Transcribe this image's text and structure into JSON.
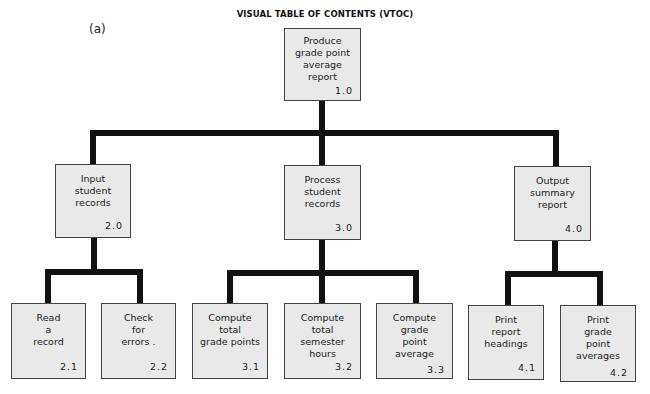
{
  "diagram": {
    "title": "VISUAL TABLE OF CONTENTS (VTOC)",
    "panel_label": "(a)",
    "line_color": "#111111",
    "box_fill": "#e9e9e9",
    "nodes": {
      "n1_0": {
        "text": "Produce\ngrade point\naverage\nreport",
        "number": "1.0"
      },
      "n2_0": {
        "text": "Input\nstudent\nrecords",
        "number": "2.0"
      },
      "n3_0": {
        "text": "Process\nstudent\nrecords",
        "number": "3.0"
      },
      "n4_0": {
        "text": "Output\nsummary\nreport",
        "number": "4.0"
      },
      "n2_1": {
        "text": "Read\na\nrecord",
        "number": "2.1"
      },
      "n2_2": {
        "text": "Check\nfor\nerrors .",
        "number": "2.2"
      },
      "n3_1": {
        "text": "Compute\ntotal\ngrade points",
        "number": "3.1"
      },
      "n3_2": {
        "text": "Compute\ntotal\nsemester\nhours",
        "number": "3.2"
      },
      "n3_3": {
        "text": "Compute\ngrade\npoint\naverage",
        "number": "3.3"
      },
      "n4_1": {
        "text": "Print\nreport\nheadings",
        "number": "4.1"
      },
      "n4_2": {
        "text": "Print\ngrade\npoint\naverages",
        "number": "4.2"
      }
    },
    "edges": [
      [
        "1.0",
        "2.0"
      ],
      [
        "1.0",
        "3.0"
      ],
      [
        "1.0",
        "4.0"
      ],
      [
        "2.0",
        "2.1"
      ],
      [
        "2.0",
        "2.2"
      ],
      [
        "3.0",
        "3.1"
      ],
      [
        "3.0",
        "3.2"
      ],
      [
        "3.0",
        "3.3"
      ],
      [
        "4.0",
        "4.1"
      ],
      [
        "4.0",
        "4.2"
      ]
    ]
  }
}
